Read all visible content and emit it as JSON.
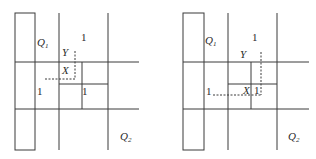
{
  "panels": [
    {
      "name": "left",
      "labels": {
        "q1": "Q",
        "q1_sub": "1",
        "q2": "Q",
        "q2_sub": "2",
        "y": "Y",
        "x": "X",
        "one_top": "1",
        "one_left": "1",
        "one_inner": "1"
      }
    },
    {
      "name": "right",
      "labels": {
        "q1": "Q",
        "q1_sub": "1",
        "q2": "Q",
        "q2_sub": "2",
        "y": "Y",
        "x": "X",
        "one_top": "1",
        "one_left": "1",
        "one_inner": "1"
      }
    }
  ]
}
